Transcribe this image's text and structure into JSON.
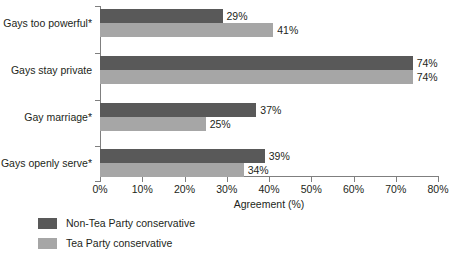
{
  "chart_data": {
    "type": "bar",
    "orientation": "horizontal",
    "title": "",
    "xlabel": "Agreement (%)",
    "ylabel": "",
    "xlim": [
      0,
      80
    ],
    "xticks": [
      "0%",
      "10%",
      "20%",
      "30%",
      "40%",
      "50%",
      "60%",
      "70%",
      "80%"
    ],
    "xtick_values": [
      0,
      10,
      20,
      30,
      40,
      50,
      60,
      70,
      80
    ],
    "grid": false,
    "legend_position": "bottom-left",
    "categories": [
      "Gays too powerful*",
      "Gays stay private",
      "Gay marriage*",
      "Gays openly serve*"
    ],
    "series": [
      {
        "name": "Non-Tea Party conservative",
        "color": "#595959",
        "values": [
          29,
          74,
          37,
          39
        ],
        "labels": [
          "29%",
          "74%",
          "37%",
          "39%"
        ]
      },
      {
        "name": "Tea Party conservative",
        "color": "#a6a6a6",
        "values": [
          41,
          74,
          25,
          34
        ],
        "labels": [
          "41%",
          "74%",
          "25%",
          "34%"
        ]
      }
    ]
  },
  "legend": {
    "items": [
      {
        "label": "Non-Tea Party conservative",
        "color": "#595959"
      },
      {
        "label": "Tea Party conservative",
        "color": "#a6a6a6"
      }
    ]
  },
  "axis": {
    "x_title": "Agreement (%)"
  }
}
